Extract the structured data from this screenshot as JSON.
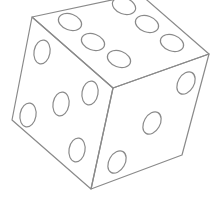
{
  "image": {
    "subject": "die line drawing",
    "stroke_color": "#8a8a8a",
    "background": "#ffffff",
    "faces": {
      "top": {
        "pips": 6
      },
      "left": {
        "pips": 5
      },
      "right": {
        "pips": 3
      }
    }
  }
}
